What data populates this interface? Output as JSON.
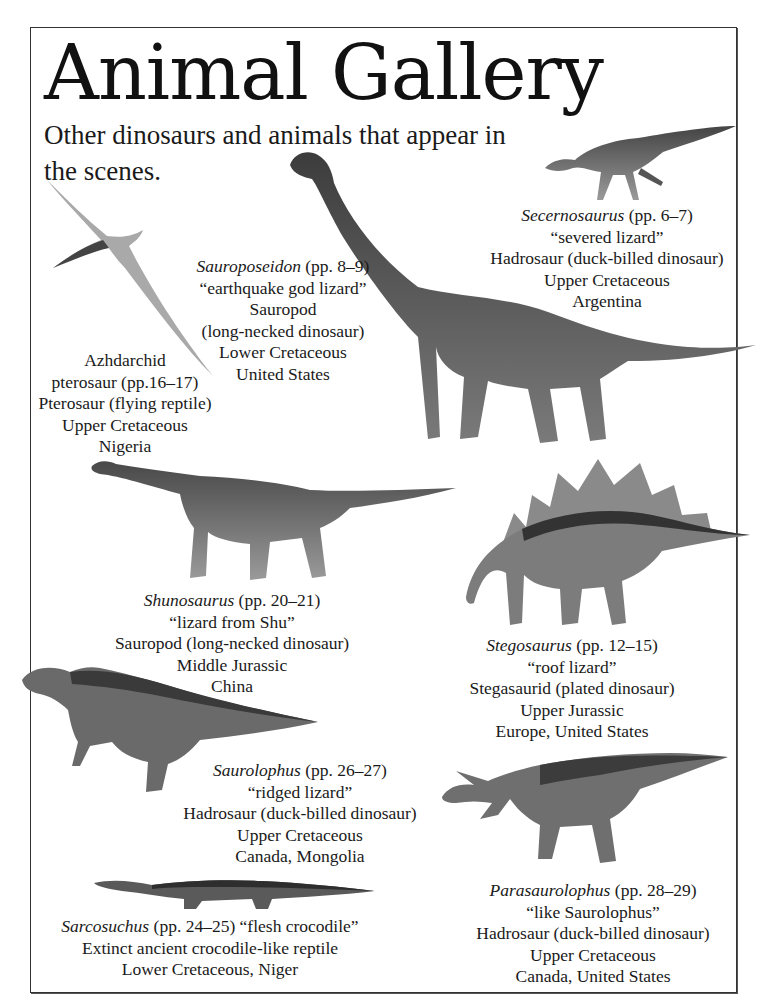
{
  "page": {
    "title": "Animal Gallery",
    "subtitle": "Other dinosaurs and animals that appear in the scenes."
  },
  "animals": [
    {
      "id": "secernosaurus",
      "name": "Secernosaurus",
      "pages": "(pp. 6–7)",
      "meaning": "“severed lizard”",
      "type": "Hadrosaur (duck-billed dinosaur)",
      "period": "Upper Cretaceous",
      "location": "Argentina"
    },
    {
      "id": "sauroposeidon",
      "name": "Sauroposeidon",
      "pages": "(pp. 8–9)",
      "meaning": "“earthquake god lizard”",
      "type_line1": "Sauropod",
      "type_line2": "(long-necked dinosaur)",
      "period": "Lower Cretaceous",
      "location": "United States"
    },
    {
      "id": "azhdarchid",
      "name_line1": "Azhdarchid",
      "name_line2": "pterosaur (pp.16–17)",
      "type": "Pterosaur (flying reptile)",
      "period": "Upper Cretaceous",
      "location": "Nigeria"
    },
    {
      "id": "shunosaurus",
      "name": "Shunosaurus",
      "pages": "(pp. 20–21)",
      "meaning": "“lizard from Shu”",
      "type": "Sauropod (long-necked dinosaur)",
      "period": "Middle Jurassic",
      "location": "China"
    },
    {
      "id": "stegosaurus",
      "name": "Stegosaurus",
      "pages": "(pp. 12–15)",
      "meaning": "“roof lizard”",
      "type": "Stegasaurid (plated dinosaur)",
      "period": "Upper Jurassic",
      "location": "Europe, United States"
    },
    {
      "id": "saurolophus",
      "name": "Saurolophus",
      "pages": "(pp. 26–27)",
      "meaning": "“ridged lizard”",
      "type": "Hadrosaur (duck-billed dinosaur)",
      "period": "Upper Cretaceous",
      "location": "Canada, Mongolia"
    },
    {
      "id": "sarcosuchus",
      "name": "Sarcosuchus",
      "pages_meaning": "(pp. 24–25) “flesh crocodile”",
      "type": "Extinct ancient crocodile-like reptile",
      "period_location": "Lower Cretaceous, Niger"
    },
    {
      "id": "parasaurolophus",
      "name": "Parasaurolophus",
      "pages": "(pp. 28–29)",
      "meaning": "“like Saurolophus”",
      "type": "Hadrosaur (duck-billed dinosaur)",
      "period": "Upper Cretaceous",
      "location": "Canada, United States"
    }
  ],
  "colors": {
    "text": "#1a1a1a",
    "border": "#333333",
    "animal_dark": "#3a3a3a",
    "animal_mid": "#6e6e6e",
    "animal_light": "#b5b5b5"
  }
}
